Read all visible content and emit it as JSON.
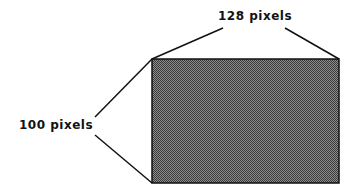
{
  "diagram": {
    "width_label": "128 pixels",
    "height_label": "100 pixels",
    "rect": {
      "x": 152,
      "y": 59,
      "w": 187,
      "h": 124
    },
    "fill_pattern": "checkerboard-gray",
    "stroke_color": "#111111"
  }
}
